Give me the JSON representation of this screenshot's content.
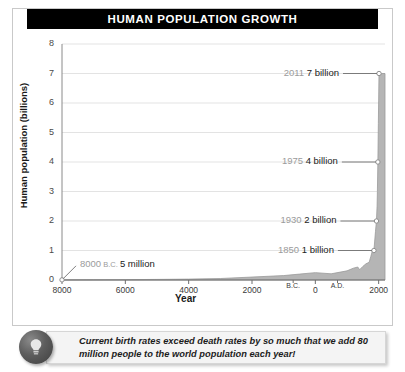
{
  "figure": {
    "title": "HUMAN POPULATION GROWTH"
  },
  "chart_data": {
    "type": "area",
    "title": "HUMAN POPULATION GROWTH",
    "xlabel": "Year",
    "ylabel": "Human population (billions)",
    "xlim": [
      -8000,
      2200
    ],
    "ylim": [
      0,
      8
    ],
    "y_ticks": [
      "8",
      "7",
      "6",
      "5",
      "4",
      "3",
      "2",
      "1",
      "0"
    ],
    "x_ticks": [
      {
        "label": "8000",
        "year": -8000
      },
      {
        "label": "6000",
        "year": -6000
      },
      {
        "label": "4000",
        "year": -4000
      },
      {
        "label": "2000",
        "year": -2000
      },
      {
        "label": "B.C.",
        "year": -700
      },
      {
        "label": "0",
        "year": 0
      },
      {
        "label": "A.D.",
        "year": 700
      },
      {
        "label": "2000",
        "year": 2000
      }
    ],
    "grid": true,
    "legend": "none",
    "series": [
      {
        "name": "Human population",
        "units": "billions",
        "x": [
          -8000,
          -7000,
          -6000,
          -5000,
          -4000,
          -3000,
          -2000,
          -1000,
          -500,
          0,
          500,
          1000,
          1200,
          1340,
          1400,
          1500,
          1600,
          1700,
          1750,
          1800,
          1850,
          1900,
          1930,
          1950,
          1960,
          1975,
          1990,
          2000,
          2011
        ],
        "y": [
          0.005,
          0.008,
          0.012,
          0.02,
          0.03,
          0.05,
          0.1,
          0.15,
          0.2,
          0.25,
          0.21,
          0.31,
          0.4,
          0.44,
          0.35,
          0.46,
          0.55,
          0.6,
          0.79,
          0.98,
          1.0,
          1.65,
          2.0,
          2.5,
          3.0,
          4.0,
          5.3,
          6.1,
          7.0
        ]
      }
    ],
    "annotations": [
      {
        "id": "a-8000bc",
        "year_label": "8000 B.C.",
        "value_label": "5 million",
        "year": -8000,
        "value": 0.005
      },
      {
        "id": "a-1850",
        "year_label": "1850",
        "value_label": "1 billion",
        "year": 1850,
        "value": 1
      },
      {
        "id": "a-1930",
        "year_label": "1930",
        "value_label": "2 billion",
        "year": 1930,
        "value": 2
      },
      {
        "id": "a-1975",
        "year_label": "1975",
        "value_label": "4 billion",
        "year": 1975,
        "value": 4
      },
      {
        "id": "a-2011",
        "year_label": "2011",
        "value_label": "7 billion",
        "year": 2011,
        "value": 7
      }
    ],
    "colors": {
      "area_fill": "#b5b5b5",
      "area_edge": "#9a9a9a",
      "grid": "#e3e3e3",
      "axis": "#6e6e6e",
      "title_bg": "#000000",
      "title_fg": "#ffffff",
      "annotation_year": "#9b9b9b",
      "annotation_value": "#222222"
    }
  },
  "caption": {
    "icon": "lightbulb-icon",
    "text": "Current birth rates exceed death rates by so much that we add 80 million people to the world population each year!"
  }
}
